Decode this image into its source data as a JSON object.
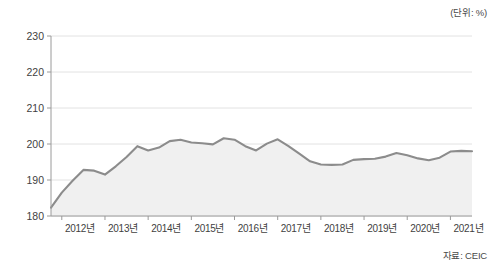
{
  "unit_label": "(단위: %)",
  "source_label": "자료: CEIC",
  "chart_data": {
    "type": "area",
    "title": "",
    "subtitle": "",
    "xlabel": "",
    "ylabel": "",
    "unit": "%",
    "source": "CEIC",
    "grid": true,
    "legend": false,
    "line_color": "#8c8c8c",
    "fill_color": "#f0f0f0",
    "grid_color": "#e2e2e2",
    "axis_color": "#9a9a9a",
    "ylim": [
      180,
      230
    ],
    "yticks": [
      180,
      190,
      200,
      210,
      220,
      230
    ],
    "ytick_labels": [
      "180",
      "190",
      "200",
      "210",
      "220",
      "230"
    ],
    "xtick_labels": [
      "2012년",
      "2013년",
      "2014년",
      "2015년",
      "2016년",
      "2017년",
      "2018년",
      "2019년",
      "2020년",
      "2021년"
    ],
    "xlim": [
      2011.75,
      2021.5
    ],
    "x": [
      2011.75,
      2012.0,
      2012.25,
      2012.5,
      2012.75,
      2013.0,
      2013.25,
      2013.5,
      2013.75,
      2014.0,
      2014.25,
      2014.5,
      2014.75,
      2015.0,
      2015.25,
      2015.5,
      2015.75,
      2016.0,
      2016.25,
      2016.5,
      2016.75,
      2017.0,
      2017.25,
      2017.5,
      2017.75,
      2018.0,
      2018.25,
      2018.5,
      2018.75,
      2019.0,
      2019.25,
      2019.5,
      2019.75,
      2020.0,
      2020.25,
      2020.5,
      2020.75,
      2021.0,
      2021.25,
      2021.5
    ],
    "values": [
      182.3,
      186.5,
      189.8,
      192.8,
      192.6,
      191.5,
      193.8,
      196.4,
      199.4,
      198.2,
      199.0,
      200.8,
      201.2,
      200.4,
      200.2,
      199.9,
      201.6,
      201.2,
      199.4,
      198.2,
      200.1,
      201.3,
      199.4,
      197.3,
      195.2,
      194.3,
      194.2,
      194.3,
      195.6,
      195.8,
      195.9,
      196.5,
      197.5,
      196.9,
      196.0,
      195.5,
      196.2,
      197.9,
      198.1,
      198.0
    ],
    "series_name": "가계부채 비율",
    "y_start": 182.3,
    "y_end": 225.0,
    "y_max": 225.0,
    "y_min": 182.3
  },
  "full_series": {
    "x": [
      2011.75,
      2012.0,
      2012.25,
      2012.5,
      2012.75,
      2013.0,
      2013.25,
      2013.5,
      2013.75,
      2014.0,
      2014.25,
      2014.5,
      2014.75,
      2015.0,
      2015.25,
      2015.5,
      2015.75,
      2016.0,
      2016.25,
      2016.5,
      2016.75,
      2017.0,
      2017.25,
      2017.5,
      2017.75,
      2018.0,
      2018.25,
      2018.5,
      2018.75,
      2019.0,
      2019.25,
      2019.5,
      2019.75,
      2020.0,
      2020.25,
      2020.5,
      2020.75,
      2021.0,
      2021.25,
      2021.5
    ],
    "y": [
      182.3,
      186.5,
      189.8,
      192.8,
      192.6,
      191.5,
      193.8,
      196.4,
      199.4,
      198.2,
      199.0,
      200.8,
      201.2,
      200.4,
      200.2,
      199.9,
      201.6,
      201.2,
      199.4,
      198.2,
      200.1,
      201.3,
      199.4,
      197.3,
      195.2,
      194.3,
      194.2,
      194.3,
      195.6,
      195.8,
      195.9,
      196.5,
      197.5,
      196.9,
      196.0,
      195.5,
      196.2,
      197.9,
      198.1,
      198.0
    ]
  }
}
